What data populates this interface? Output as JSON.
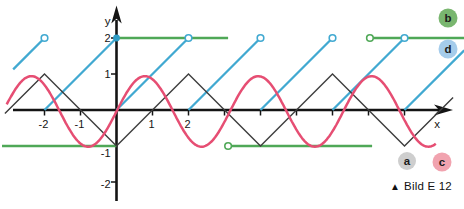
{
  "caption": {
    "marker": "▲",
    "text": "Bild E 12"
  },
  "chart_data": {
    "type": "line",
    "title": "",
    "xlabel": "x",
    "ylabel": "y",
    "xlim": [
      -3.2,
      9.7
    ],
    "ylim": [
      -2.6,
      2.9
    ],
    "grid": false,
    "unit_px": 36,
    "origin_px": {
      "x": 116.5,
      "y": 110
    },
    "axis_color": "#141414",
    "text_color": "#141414",
    "x_ticks": [
      -2,
      -1,
      1,
      2,
      3,
      4,
      5,
      6,
      7,
      8
    ],
    "x_tick_labels": [
      {
        "u": -2,
        "label": "-2"
      },
      {
        "u": -1,
        "label": "-1"
      },
      {
        "u": 1,
        "label": "1"
      },
      {
        "u": 2,
        "label": "2"
      }
    ],
    "y_tick_labels": [
      {
        "v": 2,
        "label": "2"
      },
      {
        "v": 1,
        "label": "1"
      },
      {
        "v": -1,
        "label": "-1"
      },
      {
        "v": -2,
        "label": "-2"
      }
    ],
    "series": [
      {
        "id": "b",
        "kind": "step",
        "desc": "square/step wave",
        "color": "#4fa857",
        "stroke_width": 2.3,
        "segments": [
          {
            "x1": -3.18,
            "y1": -1,
            "x2": 0,
            "y2": -1
          },
          {
            "x1": 0,
            "y1": 2,
            "x2": 3.1,
            "y2": 2
          },
          {
            "x1": 3.18,
            "y1": -1,
            "x2": 7.1,
            "y2": -1
          },
          {
            "x1": 7.14,
            "y1": 2,
            "x2": 9.66,
            "y2": 2
          }
        ],
        "open_points": [
          [
            3.1,
            -1
          ],
          [
            7.04,
            2
          ]
        ],
        "closed_points": []
      },
      {
        "id": "d",
        "kind": "sawtooth",
        "desc": "sawtooth wave, period 2, rises 0 to 2",
        "color": "#41a9d1",
        "stroke_width": 2.3,
        "segments": [
          {
            "x1": -2.87,
            "y1": 1.13,
            "x2": -2,
            "y2": 2
          },
          {
            "x1": -2,
            "y1": 0,
            "x2": 0,
            "y2": 2
          },
          {
            "x1": 0,
            "y1": 0,
            "x2": 2,
            "y2": 2
          },
          {
            "x1": 2,
            "y1": 0,
            "x2": 4,
            "y2": 2
          },
          {
            "x1": 4,
            "y1": 0,
            "x2": 6,
            "y2": 2
          },
          {
            "x1": 6,
            "y1": 0,
            "x2": 8,
            "y2": 2
          },
          {
            "x1": 8,
            "y1": 0,
            "x2": 9.66,
            "y2": 1.66
          }
        ],
        "open_points": [
          [
            -2,
            2
          ],
          [
            2,
            2
          ],
          [
            4,
            2
          ],
          [
            6,
            2
          ],
          [
            8,
            2
          ]
        ],
        "closed_points": [
          [
            0,
            2
          ]
        ],
        "closed_point_color": "#2f9dc6"
      },
      {
        "id": "a",
        "kind": "polyline",
        "desc": "triangle wave, period 4, peaks at x=-2,2,6",
        "color": "#3d3d3d",
        "stroke_width": 1.4,
        "points": [
          [
            -3.1,
            -0.1
          ],
          [
            -2,
            1
          ],
          [
            0,
            -1
          ],
          [
            2,
            1
          ],
          [
            4,
            -1
          ],
          [
            6,
            1
          ],
          [
            8,
            -1
          ],
          [
            9.35,
            0.35
          ]
        ]
      },
      {
        "id": "c",
        "kind": "sine",
        "desc": "sine wave ~ sin(2x)",
        "color": "#e64e73",
        "stroke_width": 2.5,
        "amplitude": 0.98,
        "offset": -0.04,
        "period": 3.15,
        "phase": 0,
        "x_start": -3.05,
        "x_end": 8.9
      }
    ],
    "legend": [
      {
        "label": "b",
        "fill": "#79b66f",
        "text_color": "#1c1c1c",
        "cx": 448,
        "cy": 18,
        "r": 9.5
      },
      {
        "label": "d",
        "fill": "#a5cceb",
        "text_color": "#1c1c1c",
        "cx": 448,
        "cy": 49,
        "r": 9.5
      },
      {
        "label": "a",
        "fill": "#cecece",
        "text_color": "#1c1c1c",
        "cx": 407,
        "cy": 161,
        "r": 9
      },
      {
        "label": "c",
        "fill": "#f1a3af",
        "text_color": "#1c1c1c",
        "cx": 442,
        "cy": 162,
        "r": 9.5
      }
    ]
  }
}
